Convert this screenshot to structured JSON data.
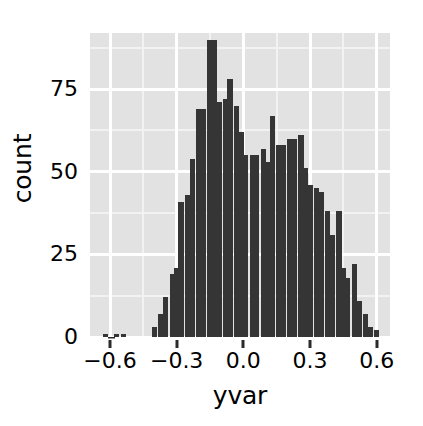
{
  "chart_data": {
    "type": "bar",
    "title": "",
    "subtitle": "",
    "xlabel": "yvar",
    "ylabel": "count",
    "xlim": [
      -0.69,
      0.66
    ],
    "ylim": [
      0,
      92
    ],
    "grid": true,
    "legend": null,
    "bin_width": 0.0245,
    "x_ticks": [
      -0.6,
      -0.3,
      0.0,
      0.3,
      0.6
    ],
    "x_tick_labels": [
      "-0.6",
      "-0.3",
      "0.0",
      "0.3",
      "0.6"
    ],
    "y_ticks": [
      0,
      25,
      50,
      75
    ],
    "y_tick_labels": [
      "0",
      "25",
      "50",
      "75"
    ],
    "bar_color": "#353535",
    "panel_color": "#e2e2e2",
    "gridline_color": "#ffffff",
    "bin_centers": [
      -0.62,
      -0.59,
      -0.57,
      -0.54,
      -0.52,
      -0.49,
      -0.47,
      -0.44,
      -0.42,
      -0.4,
      -0.37,
      -0.35,
      -0.32,
      -0.3,
      -0.28,
      -0.25,
      -0.23,
      -0.2,
      -0.18,
      -0.15,
      -0.13,
      -0.11,
      -0.08,
      -0.06,
      -0.03,
      -0.01,
      0.01,
      0.04,
      0.06,
      0.09,
      0.11,
      0.13,
      0.16,
      0.18,
      0.21,
      0.23,
      0.26,
      0.28,
      0.3,
      0.33,
      0.35,
      0.38,
      0.4,
      0.43,
      0.45,
      0.47,
      0.5,
      0.52,
      0.55,
      0.57,
      0.6
    ],
    "counts": [
      1,
      0,
      1,
      1,
      0,
      0,
      0,
      0,
      0,
      3,
      7,
      12,
      19,
      21,
      41,
      43,
      54,
      69,
      69,
      90,
      90,
      71,
      72,
      78,
      70,
      62,
      55,
      55,
      55,
      57,
      53,
      67,
      58,
      58,
      60,
      60,
      61,
      51,
      46,
      45,
      44,
      38,
      31,
      38,
      21,
      18,
      22,
      11,
      7,
      3,
      2
    ]
  }
}
